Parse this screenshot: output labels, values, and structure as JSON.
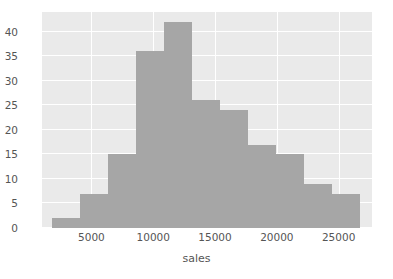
{
  "chart_data": {
    "type": "bar",
    "title": "",
    "xlabel": "sales",
    "ylabel": "",
    "grid": true,
    "legend": false,
    "bin_edges": [
      1800,
      4070,
      6340,
      8610,
      10880,
      13150,
      15420,
      17690,
      19960,
      22230,
      24500,
      26770
    ],
    "categories": [
      "1800-4070",
      "4070-6340",
      "6340-8610",
      "8610-10880",
      "10880-13150",
      "13150-15420",
      "15420-17690",
      "17690-19960",
      "19960-22230",
      "22230-24500",
      "24500-26770"
    ],
    "values": [
      2,
      7,
      15,
      36,
      42,
      26,
      24,
      17,
      15,
      9,
      7
    ],
    "xlim": [
      1000,
      27700
    ],
    "ylim": [
      0,
      44
    ],
    "xticks": [
      5000,
      10000,
      15000,
      20000,
      25000
    ],
    "xtick_labels": [
      "5000",
      "10000",
      "15000",
      "20000",
      "25000"
    ],
    "yticks": [
      0,
      5,
      10,
      15,
      20,
      25,
      30,
      35,
      40
    ],
    "ytick_labels": [
      "0",
      "5",
      "10",
      "15",
      "20",
      "25",
      "30",
      "35",
      "40"
    ],
    "bar_color": "#a6a6a6",
    "plot_background": "#eaeaea",
    "grid_color": "#ffffff",
    "figure_background": "#ffffff",
    "tick_color": "#555555"
  }
}
